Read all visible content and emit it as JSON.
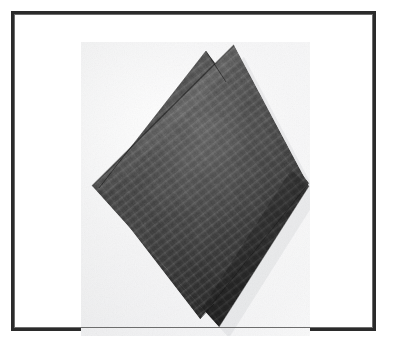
{
  "page": {
    "width": 396,
    "height": 351,
    "background_color": "#ffffff",
    "type": "framed-photograph"
  },
  "frame": {
    "name": "photo-frame",
    "border_color": "#2b2b2b",
    "border_inner_color": "#6d6d6d",
    "border_width_px": 3,
    "x": 11,
    "y": 11,
    "width": 365,
    "height": 320,
    "fill_color": "#ffffff"
  },
  "photo": {
    "name": "fabric-sample-photograph",
    "x": 67,
    "y": 28,
    "width": 229,
    "height": 294,
    "paper_color_light": "#fcfcfc",
    "paper_color_shadow": "#e6e7ea",
    "subject": "two overlapping square fabric swatches rotated to a diamond orientation",
    "caption": ""
  },
  "subject": {
    "material": "dark woven textile swatch",
    "color_base": "#3a3a3a",
    "color_dark": "#161616",
    "color_light": "#6a6a6a",
    "count": 2,
    "orientation": "diamond / rotated square",
    "sheets": [
      {
        "name": "rear-fabric-sheet",
        "label": "rear swatch",
        "tone": "#343434",
        "points": "125,9 18,146 119,277 228,141"
      },
      {
        "name": "front-fabric-sheet",
        "label": "front swatch",
        "tone": "#3d3d3d",
        "points": "153,3 11,144 138,285 228,144"
      }
    ]
  },
  "colors": {
    "frame_dark": "#2b2b2b",
    "frame_light": "#6d6d6d",
    "page_white": "#ffffff",
    "photo_paper": "#f4f5f6",
    "fabric_mid": "#3a3a3a",
    "fabric_shadow": "#151515",
    "fabric_highlight": "#707070"
  }
}
